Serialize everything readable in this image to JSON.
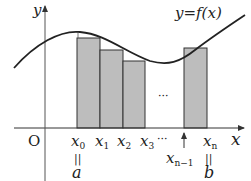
{
  "diagram": {
    "curve_label": "y=f(x)",
    "axis": {
      "x_label": "x",
      "y_label": "y",
      "origin_label": "O"
    },
    "points": [
      {
        "label": "x",
        "sub": "0"
      },
      {
        "label": "x",
        "sub": "1"
      },
      {
        "label": "x",
        "sub": "2"
      },
      {
        "label": "x",
        "sub": "3"
      },
      {
        "label": "x",
        "sub": "n−1"
      },
      {
        "label": "x",
        "sub": "n"
      }
    ],
    "ellipsis_axis": "···",
    "ellipsis_middle": "···",
    "equals_sign": "||",
    "a_label": "a",
    "b_label": "b",
    "colors": {
      "rect_fill": "#bdbdbd",
      "rect_stroke": "#333333",
      "curve": "#222222",
      "axis": "#333333"
    }
  }
}
